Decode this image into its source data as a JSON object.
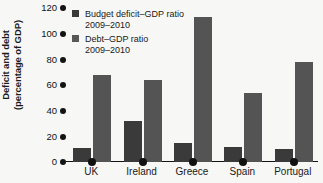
{
  "chart_data": {
    "type": "bar",
    "title": "",
    "xlabel": "",
    "ylabel": "Deficit and debt (percentage of GDP)",
    "ylabel_line1": "Deficit and debt",
    "ylabel_line2": "(percentage of GDP)",
    "ylim": [
      0,
      120
    ],
    "yticks": [
      0,
      20,
      40,
      60,
      80,
      100,
      120
    ],
    "ytick_labels": [
      "0",
      "20",
      "40",
      "60",
      "80",
      "100",
      "120"
    ],
    "grid": false,
    "legend_position": "top-left",
    "categories": [
      "UK",
      "Ireland",
      "Greece",
      "Spain",
      "Portugal"
    ],
    "series": [
      {
        "name": "Budget deficit–GDP ratio 2009–2010",
        "name_line1": "Budget deficit–GDP ratio",
        "name_line2": "2009–2010",
        "color": "#3a3a3a",
        "values": [
          11,
          32,
          15,
          12,
          10
        ]
      },
      {
        "name": "Debt–GDP ratio 2009–2010",
        "name_line1": "Debt–GDP ratio",
        "name_line2": "2009–2010",
        "color": "#545454",
        "values": [
          68,
          64,
          113,
          54,
          78
        ]
      }
    ]
  },
  "colors": {
    "background": "#f7f7f5",
    "axis": "#141414",
    "text": "#1a1a1a",
    "deficit_bar": "#3a3a3a",
    "debt_bar": "#545454"
  }
}
